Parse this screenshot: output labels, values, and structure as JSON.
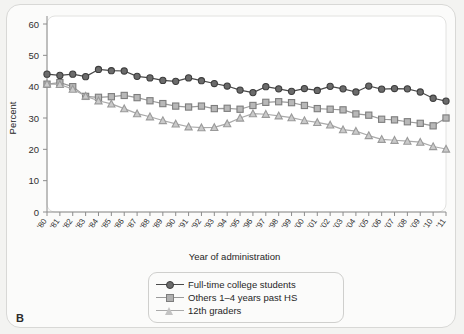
{
  "panel": {
    "letter": "B"
  },
  "chart_data": {
    "type": "line",
    "title": "",
    "xlabel": "Year of administration",
    "ylabel": "Percent",
    "ylim": [
      0,
      60
    ],
    "yticks": [
      0,
      10,
      20,
      30,
      40,
      50,
      60
    ],
    "grid": false,
    "legend_position": "below-plot",
    "x": [
      "'80",
      "'81",
      "'82",
      "'83",
      "'84",
      "'85",
      "'86",
      "'87",
      "'88",
      "'89",
      "'90",
      "'91",
      "'92",
      "'93",
      "'94",
      "'95",
      "'96",
      "'97",
      "'98",
      "'99",
      "'00",
      "'01",
      "'02",
      "'03",
      "'04",
      "'05",
      "'06",
      "'07",
      "'08",
      "'09",
      "'10",
      "'11"
    ],
    "categories": [
      "'80",
      "'81",
      "'82",
      "'83",
      "'84",
      "'85",
      "'86",
      "'87",
      "'88",
      "'89",
      "'90",
      "'91",
      "'92",
      "'93",
      "'94",
      "'95",
      "'96",
      "'97",
      "'98",
      "'99",
      "'00",
      "'01",
      "'02",
      "'03",
      "'04",
      "'05",
      "'06",
      "'07",
      "'08",
      "'09",
      "'10",
      "'11"
    ],
    "series": [
      {
        "name": "Full-time college students",
        "marker": "circle",
        "color": "#6b6b6b",
        "line_color": "#4a4a4a",
        "values": [
          44.0,
          43.6,
          44.0,
          43.2,
          45.5,
          45.1,
          45.0,
          43.3,
          42.8,
          42.0,
          41.7,
          42.8,
          41.9,
          41.0,
          40.2,
          38.9,
          38.1,
          40.0,
          39.3,
          38.5,
          39.4,
          38.8,
          40.1,
          39.3,
          38.3,
          40.2,
          39.2,
          39.4,
          39.3,
          38.3,
          36.3,
          35.4
        ]
      },
      {
        "name": "Others 1–4 years past HS",
        "marker": "square",
        "color": "#a6a6a6",
        "line_color": "#9a9a9a",
        "values": [
          40.8,
          41.3,
          40.0,
          36.9,
          36.6,
          36.8,
          37.2,
          36.5,
          35.5,
          34.6,
          33.8,
          33.5,
          33.8,
          33.0,
          33.1,
          32.8,
          34.0,
          35.0,
          35.2,
          34.9,
          34.0,
          33.0,
          32.8,
          32.6,
          31.3,
          30.9,
          29.6,
          29.4,
          28.8,
          28.3,
          27.5,
          30.0
        ]
      },
      {
        "name": "12th graders",
        "marker": "triangle",
        "color": "#b4b4b4",
        "line_color": "#aaaaaa",
        "values": [
          40.9,
          40.7,
          39.2,
          37.0,
          35.5,
          34.5,
          33.0,
          31.4,
          30.4,
          29.2,
          28.1,
          27.2,
          26.9,
          27.0,
          28.2,
          30.0,
          31.4,
          31.2,
          30.7,
          30.1,
          29.2,
          28.6,
          27.8,
          26.3,
          25.8,
          24.4,
          23.2,
          22.9,
          22.6,
          22.3,
          20.9,
          20.1
        ]
      }
    ]
  },
  "legend": {
    "items": [
      {
        "label": "Full-time college students",
        "marker": "circle"
      },
      {
        "label": "Others 1–4 years past HS",
        "marker": "square"
      },
      {
        "label": "12th graders",
        "marker": "triangle"
      }
    ]
  }
}
